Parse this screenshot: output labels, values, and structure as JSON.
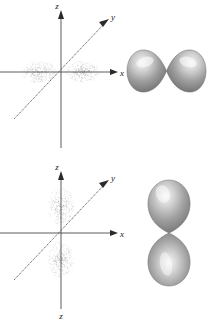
{
  "figure": {
    "background_color": "#ffffff",
    "width": 207,
    "height": 322,
    "caption": ""
  },
  "panels": [
    {
      "id": "p-orbital-px",
      "name": "px-orbital-panel",
      "axes": {
        "vertical_label": "z",
        "horizontal_label": "x",
        "diagonal_label": "y",
        "origin": {
          "x": 61,
          "y": 72
        },
        "axis_color": "#4a4a4a",
        "label_color": "#1a1a1a"
      },
      "dot_cloud": {
        "name": "electron-density-cloud-px",
        "orientation": "horizontal",
        "lobe_count": 2,
        "dot_color": "#9a9a9a",
        "center": {
          "x": 61,
          "y": 72
        },
        "lobe_offset": 22,
        "lobe_rx": 17,
        "lobe_ry": 11,
        "dot_count": 620
      },
      "surface": {
        "name": "boundary-surface-px",
        "orientation": "horizontal",
        "lobe_count": 2,
        "center": {
          "x": 167,
          "y": 70
        },
        "lobe_length": 38,
        "lobe_width": 27,
        "fill_dark": "#6f6f6f",
        "fill_mid": "#9d9d9d",
        "fill_light": "#e4e4e4",
        "edge_color": "#5a5a5a"
      }
    },
    {
      "id": "p-orbital-pz",
      "name": "pz-orbital-panel",
      "axes": {
        "vertical_label": "z",
        "vertical_label_bottom": "z",
        "horizontal_label": "x",
        "diagonal_label": "y",
        "origin": {
          "x": 61,
          "y": 72
        },
        "axis_color": "#4a4a4a",
        "label_color": "#1a1a1a"
      },
      "dot_cloud": {
        "name": "electron-density-cloud-pz",
        "orientation": "vertical",
        "lobe_count": 2,
        "dot_color": "#9a9a9a",
        "center": {
          "x": 61,
          "y": 72
        },
        "lobe_offset": 27,
        "lobe_rx": 13,
        "lobe_ry": 19,
        "dot_count": 620
      },
      "surface": {
        "name": "boundary-surface-pz",
        "orientation": "vertical",
        "lobe_count": 2,
        "center": {
          "x": 165,
          "y": 72
        },
        "lobe_length": 48,
        "lobe_width": 34,
        "fill_dark": "#6f6f6f",
        "fill_mid": "#9d9d9d",
        "fill_light": "#eaeaea",
        "edge_color": "#5a5a5a"
      }
    }
  ],
  "chart_data": {
    "type": "scatter",
    "title": "",
    "subtitle": "",
    "xlabel": "x",
    "ylabel": "z",
    "zlabel": "y",
    "grid": false,
    "legend": [],
    "annotations": [],
    "series": [
      {
        "name": "px electron density",
        "panel": "p-orbital-px",
        "representation": "dot-cloud",
        "axis_of_lobes": "x",
        "lobes": [
          {
            "center": [
              -22,
              0
            ],
            "rx": 17,
            "ry": 11
          },
          {
            "center": [
              22,
              0
            ],
            "rx": 17,
            "ry": 11
          }
        ]
      },
      {
        "name": "px boundary surface",
        "panel": "p-orbital-px",
        "representation": "solid-lobes",
        "axis_of_lobes": "x",
        "lobes": [
          {
            "center": [
              -19,
              0
            ],
            "length": 38,
            "width": 27
          },
          {
            "center": [
              19,
              0
            ],
            "length": 38,
            "width": 27
          }
        ]
      },
      {
        "name": "pz electron density",
        "panel": "p-orbital-pz",
        "representation": "dot-cloud",
        "axis_of_lobes": "z",
        "lobes": [
          {
            "center": [
              0,
              27
            ],
            "rx": 13,
            "ry": 19
          },
          {
            "center": [
              0,
              -27
            ],
            "rx": 13,
            "ry": 19
          }
        ]
      },
      {
        "name": "pz boundary surface",
        "panel": "p-orbital-pz",
        "representation": "solid-lobes",
        "axis_of_lobes": "z",
        "lobes": [
          {
            "center": [
              0,
              24
            ],
            "length": 48,
            "width": 34
          },
          {
            "center": [
              0,
              -24
            ],
            "length": 48,
            "width": 34
          }
        ]
      }
    ]
  }
}
